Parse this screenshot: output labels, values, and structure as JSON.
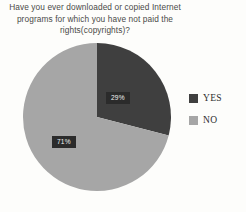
{
  "chart_data": {
    "type": "pie",
    "title": "Have you ever downloaded or copied Internet programs for which you have not paid the rights(copyrights)?",
    "categories": [
      "YES",
      "NO"
    ],
    "values": [
      29,
      71
    ],
    "data_labels": [
      "29%",
      "71%"
    ],
    "colors": [
      "#3f3f3f",
      "#a6a6a6"
    ],
    "legend": {
      "position": "right",
      "entries": [
        {
          "label": "YES",
          "color": "#3f3f3f"
        },
        {
          "label": "NO",
          "color": "#a6a6a6"
        }
      ]
    },
    "start_angle_deg": 0,
    "direction": "clockwise",
    "units": "percent",
    "grid": false,
    "xlabel": "",
    "ylabel": ""
  },
  "background_color": "#fdfdfb",
  "label_box_color": "#2b2b2b",
  "label_text_color": "#f2f2f2"
}
